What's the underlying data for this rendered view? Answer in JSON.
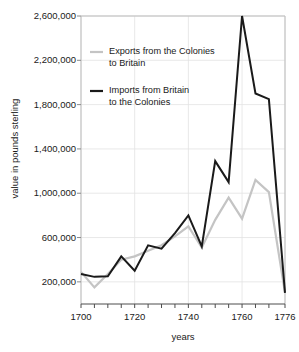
{
  "chart_data": {
    "type": "line",
    "title": "",
    "xlabel": "years",
    "ylabel": "value in pounds sterling",
    "xlim": [
      1700,
      1776
    ],
    "ylim": [
      0,
      2600000
    ],
    "grid": true,
    "legend_position": "upper-left-inside",
    "y_ticks": [
      200000,
      600000,
      1000000,
      1400000,
      1800000,
      2200000,
      2600000
    ],
    "y_tick_labels": [
      "200,000",
      "600,000",
      "1,000,000",
      "1,400,000",
      "1,800,000",
      "2,200,000",
      "2,600,000"
    ],
    "x_ticks": [
      1700,
      1705,
      1710,
      1715,
      1720,
      1725,
      1730,
      1735,
      1740,
      1745,
      1750,
      1755,
      1760,
      1765,
      1770,
      1776
    ],
    "x_tick_labels_shown": [
      "1700",
      "1720",
      "1740",
      "1760",
      "1776"
    ],
    "x_labeled_values": [
      1700,
      1720,
      1740,
      1760,
      1776
    ],
    "x": [
      1700,
      1705,
      1710,
      1715,
      1720,
      1725,
      1730,
      1735,
      1740,
      1745,
      1750,
      1755,
      1760,
      1765,
      1770,
      1776
    ],
    "series": [
      {
        "name": "Exports from the Colonies to Britain",
        "color": "#c4c4c4",
        "values": [
          290000,
          150000,
          270000,
          400000,
          430000,
          480000,
          530000,
          610000,
          700000,
          510000,
          760000,
          960000,
          770000,
          1120000,
          1010000,
          100000
        ]
      },
      {
        "name": "Imports from Britain to the Colonies",
        "color": "#1a1a1a",
        "values": [
          270000,
          245000,
          250000,
          430000,
          300000,
          530000,
          500000,
          640000,
          800000,
          520000,
          1290000,
          1100000,
          2600000,
          1900000,
          1850000,
          100000
        ]
      }
    ]
  },
  "legend": {
    "entries": [
      {
        "label": "Exports from the Colonies\nto Britain",
        "color": "#c4c4c4"
      },
      {
        "label": "Imports from Britain\nto the Colonies",
        "color": "#1a1a1a"
      }
    ]
  },
  "axes": {
    "y_title": "value in pounds sterling",
    "x_title": "years"
  }
}
